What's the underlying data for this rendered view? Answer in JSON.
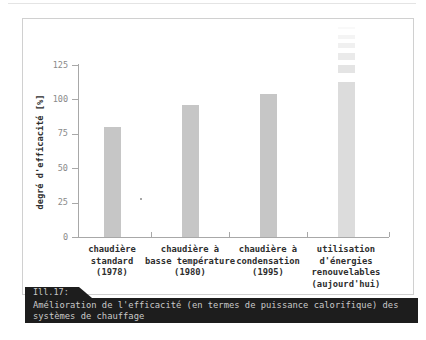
{
  "chart_data": {
    "type": "bar",
    "title": "",
    "ylabel": "degré d'efficacité [%]",
    "xlabel": "",
    "ylim": [
      0,
      125
    ],
    "yticks": [
      0,
      25,
      50,
      75,
      100,
      125
    ],
    "grid": false,
    "legend": "none",
    "categories": [
      [
        "chaudière",
        "standard",
        "(1978)"
      ],
      [
        "chaudière à",
        "basse température",
        "(1980)"
      ],
      [
        "chaudière à",
        "condensation",
        "(1995)"
      ],
      [
        "utilisation",
        "d'énergies",
        "renouvelables",
        "(aujourd'hui)"
      ]
    ],
    "values": [
      80,
      96,
      104,
      113
    ],
    "bar_colors": [
      "#c6c6c6",
      "#c6c6c6",
      "#c6c6c6",
      "#dcdcdc"
    ],
    "last_bar_extends_beyond_axis": true,
    "note": "last bar fades out in dashes above ~113%, indicating it exceeds the scale"
  },
  "caption": {
    "tab_label": "Ill.17:",
    "line1": "Amélioration de l'efficacité (en termes de puissance calorifique) des",
    "line2": "systèmes de chauffage"
  },
  "colors": {
    "background": "#ffffff",
    "frame_border": "#d0d0d0",
    "axis": "#a8a8a8",
    "tick_label": "#8a8a8a",
    "category_label": "#2e2e2e",
    "caption_bg": "#1d1d1d",
    "caption_text": "#c9c9c9"
  }
}
